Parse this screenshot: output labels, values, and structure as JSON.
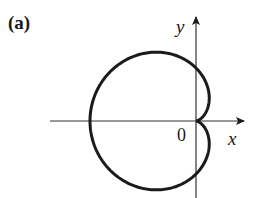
{
  "figure": {
    "panel_label": "(a)",
    "axes": {
      "x_label": "x",
      "y_label": "y",
      "origin_label": "0"
    },
    "curve": {
      "type": "polar cardioid",
      "equation": "r = 1 - cos θ",
      "stroke_color": "#1a1a1a"
    },
    "axis_color": "#333333"
  }
}
